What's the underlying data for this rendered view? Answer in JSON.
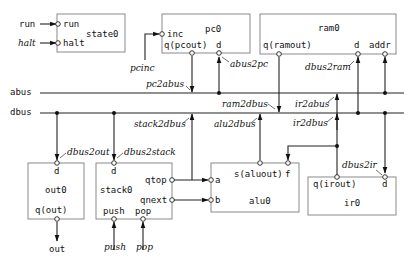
{
  "diagram": {
    "type": "datapath-block-diagram",
    "buses": [
      {
        "id": "abus",
        "label": "abus"
      },
      {
        "id": "dbus",
        "label": "dbus"
      }
    ],
    "components": {
      "state0": {
        "name": "state0",
        "ports": [
          "run",
          "halt"
        ]
      },
      "pc0": {
        "name": "pc0",
        "ports": [
          "inc",
          "q(pcout)",
          "d"
        ]
      },
      "ram0": {
        "name": "ram0",
        "ports": [
          "q(ramout)",
          "d",
          "addr"
        ]
      },
      "out0": {
        "name": "out0",
        "ports": [
          "d",
          "q(out)"
        ]
      },
      "stack0": {
        "name": "stack0",
        "ports": [
          "d",
          "qtop",
          "qnext",
          "push",
          "pop"
        ]
      },
      "alu0": {
        "name": "alu0",
        "ports": [
          "a",
          "b",
          "s(aluout)",
          "f"
        ]
      },
      "ir0": {
        "name": "ir0",
        "ports": [
          "q(irout)",
          "d"
        ]
      }
    },
    "external_signals": {
      "run": "run",
      "halt": "halt",
      "pcinc": "pcinc",
      "out": "out",
      "push": "push",
      "pop": "pop"
    },
    "control_signals": {
      "abus2pc": "abus2pc",
      "pc2abus": "pc2abus",
      "dbus2ram": "dbus2ram",
      "ram2dbus": "ram2dbus",
      "ir2abus": "ir2abus",
      "ir2dbus": "ir2dbus",
      "stack2dbus": "stack2dbus",
      "alu2dbus": "alu2dbus",
      "dbus2out": "dbus2out",
      "dbus2stack": "dbus2stack",
      "dbus2ir": "dbus2ir"
    }
  }
}
